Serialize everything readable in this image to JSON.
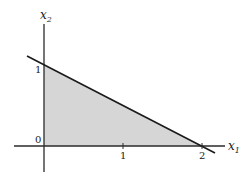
{
  "figure": {
    "axes": {
      "x_label": "x",
      "x_sub": "1",
      "y_label": "x",
      "y_sub": "2",
      "origin_label": "0"
    },
    "ticks": {
      "x": [
        "1",
        "2"
      ],
      "y": [
        "1"
      ]
    },
    "region": {
      "description": "Shaded triangle x1 + 2 x2 <= 2, x1 >= 0, x2 >= 0",
      "vertices": [
        [
          0,
          0
        ],
        [
          2,
          0
        ],
        [
          0,
          1
        ]
      ],
      "fill": "#d6d6d6"
    },
    "line": {
      "equation": "x1 + 2 x2 = 2",
      "color": "#1a1a1a"
    }
  }
}
